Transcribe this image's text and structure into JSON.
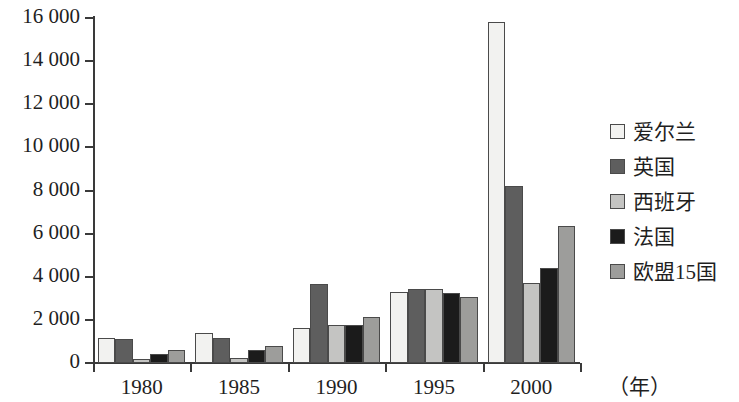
{
  "chart_data": {
    "type": "bar",
    "title": "",
    "subtitle": "",
    "xlabel": "（年）",
    "ylabel": "",
    "categories": [
      "1980",
      "1985",
      "1990",
      "1995",
      "2000"
    ],
    "ylim": [
      0,
      16000
    ],
    "yticks": [
      0,
      2000,
      4000,
      6000,
      8000,
      10000,
      12000,
      14000,
      16000
    ],
    "ytick_labels": [
      "0",
      "2 000",
      "4 000",
      "6 000",
      "8 000",
      "10 000",
      "12 000",
      "14 000",
      "16 000"
    ],
    "grid": false,
    "legend_position": "right",
    "series": [
      {
        "name": "爱尔兰",
        "color": "#f2f2f0",
        "values": [
          1150,
          1380,
          1630,
          3280,
          15800
        ]
      },
      {
        "name": "英国",
        "color": "#5e5e5e",
        "values": [
          1120,
          1180,
          3650,
          3420,
          8200
        ]
      },
      {
        "name": "西班牙",
        "color": "#c4c4c2",
        "values": [
          180,
          250,
          1780,
          3450,
          3700
        ]
      },
      {
        "name": "法国",
        "color": "#1b1b1b",
        "values": [
          420,
          620,
          1750,
          3250,
          4400
        ]
      },
      {
        "name": "欧盟15国",
        "color": "#9d9d9b",
        "values": [
          600,
          780,
          2150,
          3080,
          6350
        ]
      }
    ]
  },
  "axis": {
    "unit_label": "（年）"
  }
}
